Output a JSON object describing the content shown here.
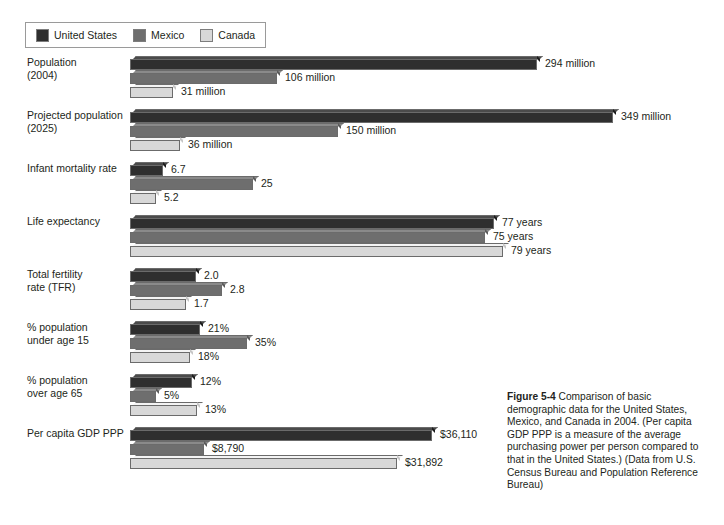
{
  "legend": {
    "entries": [
      {
        "label": "United States",
        "color": "#2f2f2f"
      },
      {
        "label": "Mexico",
        "color": "#6e6e6e"
      },
      {
        "label": "Canada",
        "color": "#d8d8d8"
      }
    ]
  },
  "caption": {
    "figure_number": "Figure 5-4",
    "text": "Comparison of basic demographic data for the United States, Mexico, and Canada in 2004. (Per capita GDP PPP is a measure of the average purchasing power per person compared to that in the United States.) (Data from U.S. Census Bureau and Population Reference Bureau)"
  },
  "chart_data": {
    "type": "bar",
    "orientation": "horizontal",
    "title": "",
    "xlabel": "",
    "ylabel": "",
    "grid": false,
    "legend_position": "top-left",
    "note": "Each category group uses its own independent horizontal scale; no axis ticks are drawn.",
    "series_names": [
      "United States",
      "Mexico",
      "Canada"
    ],
    "series_colors": [
      "#2f2f2f",
      "#6e6e6e",
      "#d8d8d8"
    ],
    "categories": [
      "Population (2004)",
      "Projected population (2025)",
      "Infant mortality rate",
      "Life expectancy",
      "Total fertility rate (TFR)",
      "% population under age 15",
      "% population over age 65",
      "Per capita GDP PPP"
    ],
    "groups": [
      {
        "label_lines": [
          "Population",
          "(2004)"
        ],
        "bars": [
          {
            "series": "United States",
            "value": 294,
            "label": "294 million",
            "bar_px": 407
          },
          {
            "series": "Mexico",
            "value": 106,
            "label": "106 million",
            "bar_px": 147
          },
          {
            "series": "Canada",
            "value": 31,
            "label": "31 million",
            "bar_px": 43
          }
        ]
      },
      {
        "label_lines": [
          "Projected population",
          "(2025)"
        ],
        "bars": [
          {
            "series": "United States",
            "value": 349,
            "label": "349 million",
            "bar_px": 483
          },
          {
            "series": "Mexico",
            "value": 150,
            "label": "150 million",
            "bar_px": 208
          },
          {
            "series": "Canada",
            "value": 36,
            "label": "36 million",
            "bar_px": 50
          }
        ]
      },
      {
        "label_lines": [
          "Infant mortality rate"
        ],
        "bars": [
          {
            "series": "United States",
            "value": 6.7,
            "label": "6.7",
            "bar_px": 33
          },
          {
            "series": "Mexico",
            "value": 25,
            "label": "25",
            "bar_px": 123
          },
          {
            "series": "Canada",
            "value": 5.2,
            "label": "5.2",
            "bar_px": 26
          }
        ]
      },
      {
        "label_lines": [
          "Life expectancy"
        ],
        "bars": [
          {
            "series": "United States",
            "value": 77,
            "label": "77 years",
            "bar_px": 364
          },
          {
            "series": "Mexico",
            "value": 75,
            "label": "75 years",
            "bar_px": 355
          },
          {
            "series": "Canada",
            "value": 79,
            "label": "79 years",
            "bar_px": 373
          }
        ]
      },
      {
        "label_lines": [
          "Total fertility",
          "rate (TFR)"
        ],
        "bars": [
          {
            "series": "United States",
            "value": 2.0,
            "label": "2.0",
            "bar_px": 66
          },
          {
            "series": "Mexico",
            "value": 2.8,
            "label": "2.8",
            "bar_px": 92
          },
          {
            "series": "Canada",
            "value": 1.7,
            "label": "1.7",
            "bar_px": 56
          }
        ]
      },
      {
        "label_lines": [
          "% population",
          "under age 15"
        ],
        "bars": [
          {
            "series": "United States",
            "value": 21,
            "label": "21%",
            "bar_px": 70
          },
          {
            "series": "Mexico",
            "value": 35,
            "label": "35%",
            "bar_px": 117
          },
          {
            "series": "Canada",
            "value": 18,
            "label": "18%",
            "bar_px": 60
          }
        ]
      },
      {
        "label_lines": [
          "% population",
          "over age 65"
        ],
        "bars": [
          {
            "series": "United States",
            "value": 12,
            "label": "12%",
            "bar_px": 62
          },
          {
            "series": "Mexico",
            "value": 5,
            "label": "5%",
            "bar_px": 26
          },
          {
            "series": "Canada",
            "value": 13,
            "label": "13%",
            "bar_px": 67
          }
        ]
      },
      {
        "label_lines": [
          "Per capita GDP PPP"
        ],
        "bars": [
          {
            "series": "United States",
            "value": 36110,
            "label": "$36,110",
            "bar_px": 302
          },
          {
            "series": "Mexico",
            "value": 8790,
            "label": "$8,790",
            "bar_px": 74
          },
          {
            "series": "Canada",
            "value": 31892,
            "label": "$31,892",
            "bar_px": 267
          }
        ]
      }
    ]
  }
}
